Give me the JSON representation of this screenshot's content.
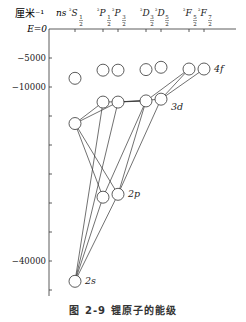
{
  "figure": {
    "y_unit_label": "厘米⁻¹",
    "zero_label": "E=0",
    "row_label": "ns",
    "caption": "图 2-9   锂原子的能级",
    "colors": {
      "line": "#333333",
      "circle_fill": "#ffffff",
      "circle_stroke": "#333333",
      "text": "#222222"
    }
  },
  "columns": [
    {
      "id": "S12",
      "term": "²S",
      "j": "1/2",
      "x": 75
    },
    {
      "id": "P12",
      "term": "²P",
      "j": "1/2",
      "x": 103
    },
    {
      "id": "P32",
      "term": "²P",
      "j": "3/2",
      "x": 118
    },
    {
      "id": "D32",
      "term": "²D",
      "j": "3/2",
      "x": 146
    },
    {
      "id": "D52",
      "term": "²D",
      "j": "5/2",
      "x": 161
    },
    {
      "id": "F52",
      "term": "²F",
      "j": "5/2",
      "x": 189
    },
    {
      "id": "F72",
      "term": "²F",
      "j": "7/2",
      "x": 204
    }
  ],
  "axis": {
    "ticks": [
      0,
      -5000,
      -10000,
      -15000,
      -20000,
      -25000,
      -30000,
      -35000,
      -40000,
      -45000
    ],
    "labeled_ticks": [
      {
        "value": -5000,
        "label": "−5000"
      },
      {
        "value": -10000,
        "label": "−10000"
      },
      {
        "value": -40000,
        "label": "−40000"
      }
    ]
  },
  "levels": [
    {
      "id": "2s",
      "col": "S12",
      "energy": -43500,
      "label": "2s"
    },
    {
      "id": "2p12",
      "col": "P12",
      "energy": -29000
    },
    {
      "id": "2p32",
      "col": "P32",
      "energy": -28500,
      "label": "2p"
    },
    {
      "id": "3s",
      "col": "S12",
      "energy": -16300
    },
    {
      "id": "3p12",
      "col": "P12",
      "energy": -12600
    },
    {
      "id": "3p32",
      "col": "P32",
      "energy": -12600
    },
    {
      "id": "3d32",
      "col": "D32",
      "energy": -12400
    },
    {
      "id": "3d52",
      "col": "D52",
      "energy": -12100,
      "label": "3d"
    },
    {
      "id": "4s",
      "col": "S12",
      "energy": -8500
    },
    {
      "id": "4p12",
      "col": "P12",
      "energy": -7100
    },
    {
      "id": "4p32",
      "col": "P32",
      "energy": -7100
    },
    {
      "id": "4d32",
      "col": "D32",
      "energy": -7000
    },
    {
      "id": "4d52",
      "col": "D52",
      "energy": -6600
    },
    {
      "id": "4f52",
      "col": "F52",
      "energy": -6900
    },
    {
      "id": "4f72",
      "col": "F72",
      "energy": -6900,
      "label": "4f"
    }
  ],
  "transitions": [
    [
      "2s",
      "2p12"
    ],
    [
      "2s",
      "2p32"
    ],
    [
      "2s",
      "3p12"
    ],
    [
      "2s",
      "3p32"
    ],
    [
      "3s",
      "2p12"
    ],
    [
      "3s",
      "2p32"
    ],
    [
      "3s",
      "3p12"
    ],
    [
      "3s",
      "3p32"
    ],
    [
      "2p12",
      "3d32"
    ],
    [
      "2p32",
      "3d32"
    ],
    [
      "2p32",
      "3d52"
    ],
    [
      "3p12",
      "3d32"
    ],
    [
      "3p32",
      "3d32"
    ],
    [
      "3p32",
      "3d52"
    ],
    [
      "3d32",
      "4f52"
    ],
    [
      "3d52",
      "4f52"
    ],
    [
      "3d52",
      "4f72"
    ]
  ]
}
